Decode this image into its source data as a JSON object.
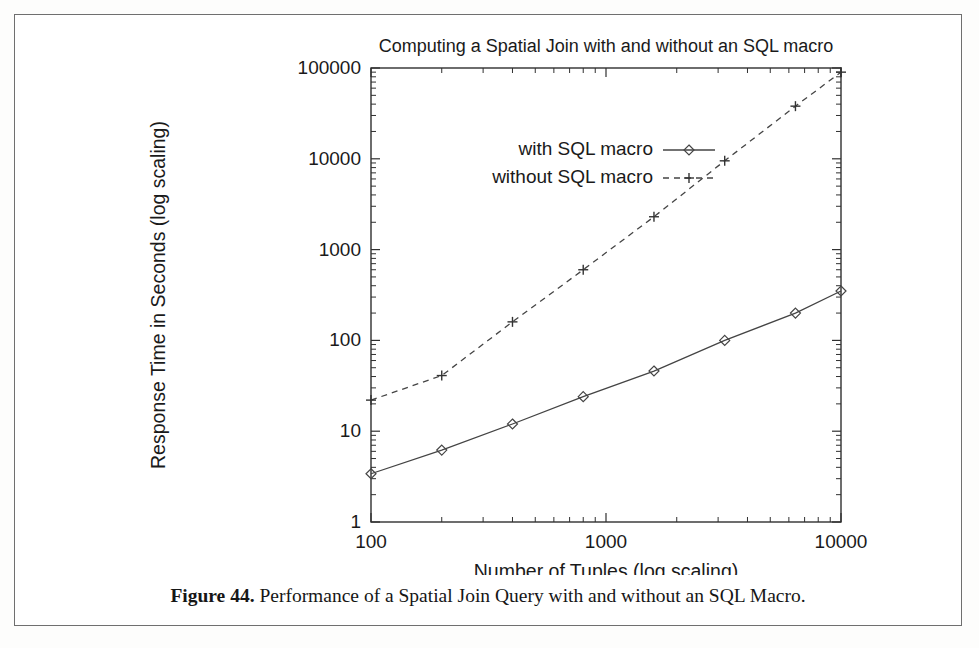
{
  "figure": {
    "caption_label": "Figure 44.",
    "caption_text": "Performance of a Spatial Join Query with and without an SQL Macro."
  },
  "chart_data": {
    "type": "line",
    "title": "Computing a Spatial Join with and without an SQL macro",
    "xlabel": "Number of Tuples (log scaling)",
    "ylabel": "Response Time in Seconds (log scaling)",
    "xscale": "log",
    "yscale": "log",
    "xlim": [
      100,
      10000
    ],
    "ylim": [
      1,
      100000
    ],
    "grid": false,
    "legend_position": "upper-left-inside",
    "x_ticks": [
      100,
      1000,
      10000
    ],
    "x_tick_labels": [
      "100",
      "1000",
      "10000"
    ],
    "y_ticks": [
      1,
      10,
      100,
      1000,
      10000,
      100000
    ],
    "y_tick_labels": [
      "1",
      "10",
      "100",
      "1000",
      "10000",
      "100000"
    ],
    "x": [
      100,
      200,
      400,
      800,
      1600,
      3200,
      6400,
      10000
    ],
    "series": [
      {
        "name": "with SQL macro",
        "marker": "diamond",
        "linestyle": "solid",
        "color": "#444444",
        "values": [
          3.4,
          6.2,
          12,
          24,
          46,
          100,
          200,
          350
        ]
      },
      {
        "name": "without SQL macro",
        "marker": "plus",
        "linestyle": "dashed",
        "color": "#444444",
        "values": [
          22,
          41,
          160,
          600,
          2300,
          9500,
          38000,
          90000
        ]
      }
    ]
  }
}
